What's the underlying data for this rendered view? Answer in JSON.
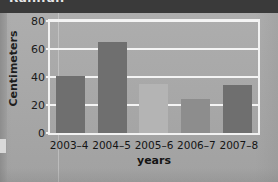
{
  "header": {
    "title_partial": "Rainfall"
  },
  "chart_data": {
    "type": "bar",
    "title": "",
    "xlabel": "years",
    "ylabel": "Centimeters",
    "categories": [
      "2003–4",
      "2004–5",
      "2005–6",
      "2006–7",
      "2007–8"
    ],
    "values": [
      41,
      65,
      35,
      24,
      34
    ],
    "ylim": [
      0,
      80
    ],
    "yticks": [
      0,
      20,
      40,
      60,
      80
    ],
    "ytick_labels": [
      "0",
      "20",
      "40",
      "60",
      "80"
    ],
    "grid": true,
    "grid_color": "#f4f4f4",
    "legend": false,
    "bar_colors": [
      "#6f6f6f",
      "#6f6f6f",
      "#b4b4b4",
      "#8d8d8d",
      "#6f6f6f"
    ],
    "plot_background": "#a6a6a6"
  },
  "colors": {
    "page_background": "#aaaaaa",
    "header_band": "#3a3a3a",
    "axis": "#f2f2f2",
    "text": "#141414"
  }
}
